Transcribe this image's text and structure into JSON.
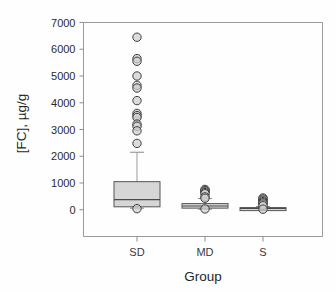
{
  "chart_data": {
    "type": "box",
    "title": "",
    "xlabel": "Group",
    "ylabel": "[FC], µg/g",
    "ylim": [
      -1000,
      7000
    ],
    "yticks": [
      0,
      1000,
      2000,
      3000,
      4000,
      5000,
      6000,
      7000
    ],
    "ytick_labels": [
      "0",
      "1000",
      "2000",
      "3000",
      "4000",
      "5000",
      "6000",
      "7000"
    ],
    "categories": [
      "SD",
      "MD",
      "S"
    ],
    "grid": false,
    "legend": "none",
    "boxes": [
      {
        "category": "SD",
        "whisker_low": 60,
        "q1": 110,
        "median": 380,
        "q3": 1050,
        "whisker_high": 2150,
        "outliers": [
          6450,
          5650,
          5550,
          5000,
          4650,
          4550,
          4080,
          3600,
          3520,
          3450,
          3200,
          3120,
          2950,
          2480,
          40
        ]
      },
      {
        "category": "MD",
        "whisker_low": 20,
        "q1": 60,
        "median": 140,
        "q3": 230,
        "whisker_high": 420,
        "outliers": [
          760,
          720,
          690,
          640,
          600,
          480,
          430,
          30
        ]
      },
      {
        "category": "S",
        "whisker_low": 10,
        "q1": 25,
        "median": 50,
        "q3": 80,
        "whisker_high": 120,
        "outliers": [
          440,
          400,
          350,
          300,
          260,
          210,
          150,
          20
        ]
      }
    ]
  },
  "colors": {
    "box_fill": "#d6d6d6",
    "box_edge": "#555555",
    "outlier_fill": "#cfcfcf",
    "outlier_edge": "#3f3f3f",
    "axis": "#9a9a9a",
    "text": "#1f1f1f"
  }
}
